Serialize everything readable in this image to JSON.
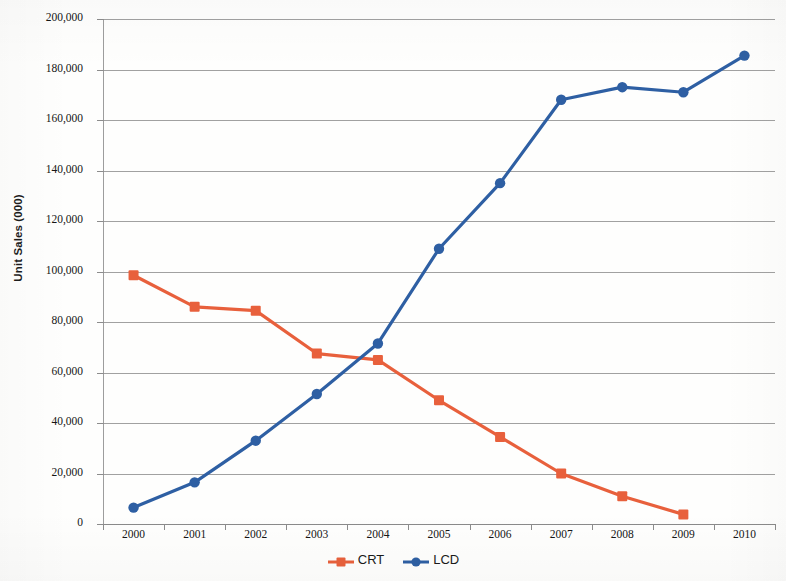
{
  "chart_data": {
    "type": "line",
    "title": "",
    "xlabel": "",
    "ylabel": "Unit Sales (000)",
    "categories": [
      "2000",
      "2001",
      "2002",
      "2003",
      "2004",
      "2005",
      "2006",
      "2007",
      "2008",
      "2009",
      "2010"
    ],
    "ylim": [
      0,
      200000
    ],
    "ytick_values": [
      0,
      20000,
      40000,
      60000,
      80000,
      100000,
      120000,
      140000,
      160000,
      180000,
      200000
    ],
    "ytick_labels": [
      "0",
      "20,000",
      "40,000",
      "60,000",
      "80,000",
      "100,000",
      "120,000",
      "140,000",
      "160,000",
      "180,000",
      "200,000"
    ],
    "grid": true,
    "legend_position": "bottom",
    "series": [
      {
        "name": "CRT",
        "color": "#E8603C",
        "marker": "square",
        "values": [
          98500,
          86000,
          84500,
          67500,
          65000,
          49000,
          34500,
          20000,
          11000,
          3800,
          null
        ]
      },
      {
        "name": "LCD",
        "color": "#2E5FA3",
        "marker": "circle",
        "values": [
          6500,
          16500,
          33000,
          51500,
          71500,
          109000,
          135000,
          168000,
          173000,
          171000,
          185500
        ]
      }
    ]
  },
  "legend": {
    "entries": [
      {
        "label": "CRT"
      },
      {
        "label": "LCD"
      }
    ]
  }
}
